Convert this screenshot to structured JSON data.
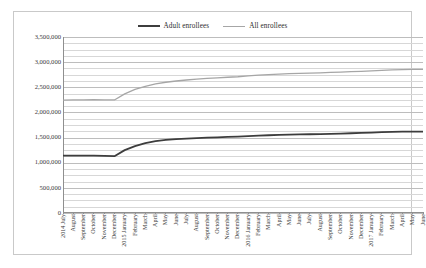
{
  "chart_data": {
    "type": "line",
    "title": "",
    "xlabel": "",
    "ylabel": "",
    "ylim": [
      0,
      3500000
    ],
    "ytick_values": [
      0,
      500000,
      1000000,
      1500000,
      2000000,
      2500000,
      3000000,
      3500000
    ],
    "ytick_labels": [
      "0",
      "500,000",
      "1,000,000",
      "1,500,000",
      "2,000,000",
      "2,500,000",
      "3,000,000",
      "3,500,000"
    ],
    "grid": true,
    "minor_gridlines": true,
    "legend_position": "top-center",
    "categories": [
      "2014 July",
      "August",
      "September",
      "October",
      "November",
      "December",
      "2015 January",
      "February",
      "March",
      "April",
      "May",
      "June",
      "July",
      "August",
      "September",
      "October",
      "November",
      "December",
      "2016 January",
      "February",
      "March",
      "April",
      "May",
      "June",
      "July",
      "August",
      "September",
      "October",
      "November",
      "December",
      "2017 January",
      "February",
      "March",
      "April",
      "May",
      "June"
    ],
    "series": [
      {
        "name": "Adult enrollees",
        "color": "#3d3d3d",
        "values": [
          1140000,
          1140000,
          1140000,
          1140000,
          1135000,
          1130000,
          1250000,
          1330000,
          1390000,
          1430000,
          1455000,
          1470000,
          1480000,
          1490000,
          1498000,
          1505000,
          1512000,
          1518000,
          1528000,
          1538000,
          1546000,
          1552000,
          1558000,
          1562000,
          1566000,
          1570000,
          1575000,
          1580000,
          1586000,
          1592000,
          1600000,
          1608000,
          1614000,
          1618000,
          1620000,
          1620000
        ]
      },
      {
        "name": "All enrollees",
        "color": "#a6a6a6",
        "values": [
          2245000,
          2248000,
          2250000,
          2252000,
          2250000,
          2248000,
          2370000,
          2460000,
          2520000,
          2568000,
          2600000,
          2625000,
          2645000,
          2662000,
          2676000,
          2688000,
          2700000,
          2710000,
          2725000,
          2740000,
          2752000,
          2762000,
          2770000,
          2776000,
          2782000,
          2788000,
          2795000,
          2802000,
          2810000,
          2818000,
          2828000,
          2838000,
          2846000,
          2852000,
          2856000,
          2858000
        ]
      }
    ]
  },
  "legend": {
    "items": [
      {
        "label": "Adult enrollees"
      },
      {
        "label": "All enrollees"
      }
    ]
  }
}
